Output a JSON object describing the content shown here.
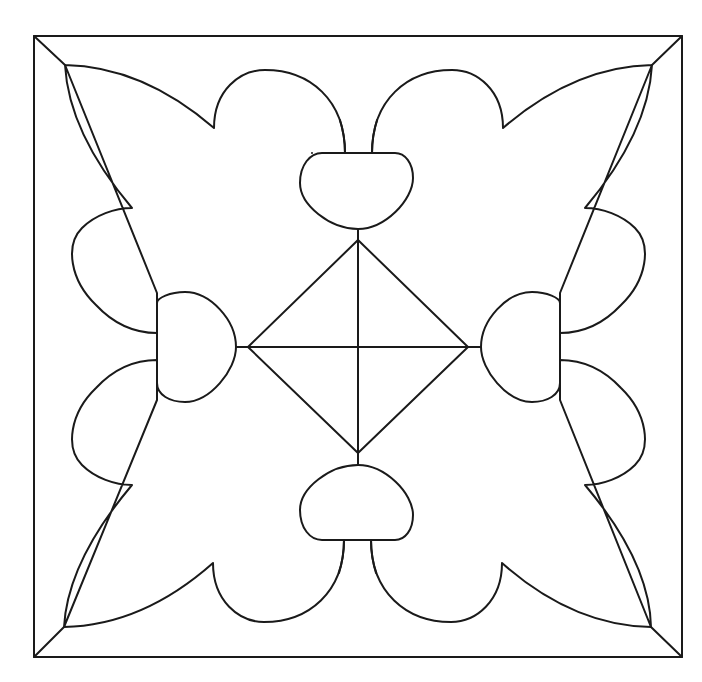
{
  "diagram": {
    "type": "line-art tile pattern",
    "stroke_color": "#1a1a1a",
    "background_color": "#ffffff",
    "frame": {
      "x": 34,
      "y": 36,
      "width": 648,
      "height": 621
    },
    "center": {
      "x": 358,
      "y": 347
    },
    "diamond": {
      "top": [
        358,
        240
      ],
      "right": [
        468,
        347
      ],
      "bottom": [
        358,
        453
      ],
      "left": [
        248,
        347
      ]
    },
    "components": [
      "outer-frame",
      "corner-miters",
      "leaf-top-left",
      "leaf-top-right",
      "leaf-bottom-left",
      "leaf-bottom-right",
      "knob-top",
      "knob-bottom",
      "knob-left",
      "knob-right",
      "center-diamond",
      "center-cross"
    ]
  }
}
